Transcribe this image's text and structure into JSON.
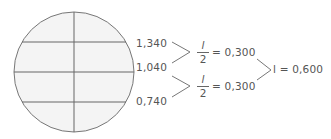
{
  "diagram": {
    "circle": {
      "cx": 74,
      "cy": 72,
      "r": 60,
      "fill": "#f4f4f4",
      "stroke": "#777777"
    },
    "gridlines": {
      "horizontal_y": [
        42,
        72,
        102
      ],
      "vertical_x": 74
    },
    "levels": [
      {
        "label": "1,340"
      },
      {
        "label": "1,040"
      },
      {
        "label": "0,740"
      }
    ],
    "differences": [
      {
        "numerator": "l",
        "denominator": "2",
        "result": "= 0,300"
      },
      {
        "numerator": "l",
        "denominator": "2",
        "result": "= 0,300"
      }
    ],
    "total": {
      "text": "l = 0,600"
    },
    "colors": {
      "line": "#777777",
      "text": "#555555",
      "fill": "#f4f4f4"
    }
  }
}
